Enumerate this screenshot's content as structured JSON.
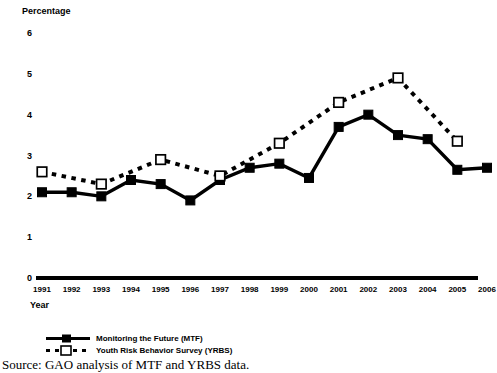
{
  "figure": {
    "source_note": "Source: GAO analysis of MTF and YRBS data."
  },
  "legend": {
    "position": "bottom-left",
    "items": [
      {
        "label": "Monitoring the Future (MTF)",
        "marker": "filled-square",
        "line": "solid",
        "color": "#000000"
      },
      {
        "label": "Youth Risk Behavior Survey (YRBS)",
        "marker": "open-square",
        "line": "dashed",
        "color": "#000000"
      }
    ]
  },
  "chart_data": {
    "type": "line",
    "title": "",
    "subtitle": "",
    "xlabel": "Year",
    "ylabel": "Percentage",
    "x": [
      1991,
      1992,
      1993,
      1994,
      1995,
      1996,
      1997,
      1998,
      1999,
      2000,
      2001,
      2002,
      2003,
      2004,
      2005,
      2006
    ],
    "categories": [
      "1991",
      "1992",
      "1993",
      "1994",
      "1995",
      "1996",
      "1997",
      "1998",
      "1999",
      "2000",
      "2001",
      "2002",
      "2003",
      "2004",
      "2005",
      "2006"
    ],
    "xlim": [
      1991,
      2006
    ],
    "ylim": [
      0,
      6
    ],
    "yticks": [
      0,
      1,
      2,
      3,
      4,
      5,
      6
    ],
    "ytick_labels": [
      "0",
      "1",
      "2",
      "3",
      "4",
      "5",
      "6"
    ],
    "grid": false,
    "legend_position": "below-axes-left",
    "series": [
      {
        "name": "Monitoring the Future (MTF)",
        "marker": "filled-square",
        "linestyle": "solid",
        "color": "#000000",
        "values": [
          2.1,
          2.1,
          2.0,
          2.4,
          2.3,
          1.9,
          2.4,
          2.7,
          2.8,
          2.45,
          3.7,
          4.0,
          3.5,
          3.4,
          2.65,
          2.7
        ]
      },
      {
        "name": "Youth Risk Behavior Survey (YRBS)",
        "marker": "open-square",
        "linestyle": "dashed",
        "color": "#000000",
        "values": [
          2.6,
          null,
          2.3,
          null,
          2.9,
          null,
          2.5,
          null,
          3.3,
          null,
          4.3,
          null,
          4.9,
          null,
          3.35,
          null
        ]
      }
    ]
  }
}
